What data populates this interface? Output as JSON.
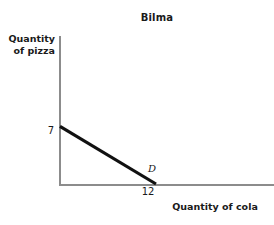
{
  "chart_data": {
    "type": "line",
    "title": "Bilma",
    "xlabel": "Quantity of cola",
    "ylabel": "Quantity of pizza",
    "grid": false,
    "legend": "none",
    "xlim": [
      0,
      26
    ],
    "ylim": [
      0,
      18
    ],
    "x_tick_labels": [
      "12"
    ],
    "y_tick_labels": [
      "7"
    ],
    "series": [
      {
        "name": "D",
        "annotation": "D",
        "color": "#111111",
        "x": [
          0,
          12
        ],
        "y": [
          7,
          0
        ],
        "description": "Production possibility frontier from 7 pizza on the vertical axis to 12 cola on the horizontal axis"
      }
    ],
    "axis_color": "#8c8c8c",
    "background_color": "#ffffff"
  },
  "figure": {
    "title": "Bilma",
    "y_label_line1": "Quantity",
    "y_label_line2": "of pizza",
    "x_label": "Quantity of cola",
    "y_intercept_value": "7",
    "x_intercept_value": "12",
    "curve_label": "D"
  }
}
